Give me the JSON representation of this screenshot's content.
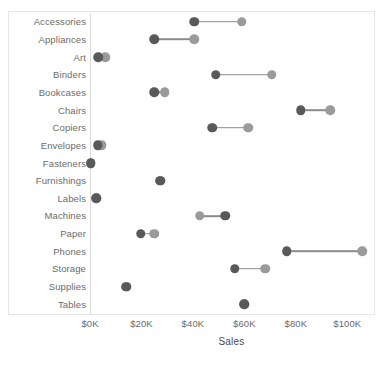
{
  "chart_data": {
    "type": "scatter",
    "subtype": "dumbbell",
    "title": "",
    "xlabel": "Sales",
    "ylabel": "",
    "xlim": [
      0,
      110
    ],
    "grid": false,
    "legend": null,
    "axis": {
      "x_ticks": [
        "$0K",
        "$20K",
        "$40K",
        "$60K",
        "$80K",
        "$100K"
      ],
      "x_tick_values": [
        0,
        20,
        40,
        60,
        80,
        100
      ],
      "x_unit": "thousand USD"
    },
    "categories": [
      "Accessories",
      "Appliances",
      "Art",
      "Binders",
      "Bookcases",
      "Chairs",
      "Copiers",
      "Envelopes",
      "Fasteners",
      "Furnishings",
      "Labels",
      "Machines",
      "Paper",
      "Phones",
      "Storage",
      "Supplies",
      "Tables"
    ],
    "series": [
      {
        "name": "dark",
        "color": "#595959",
        "values": [
          40.5,
          25.0,
          3.3,
          48.8,
          25.0,
          82.0,
          47.5,
          3.0,
          0.3,
          27.3,
          2.5,
          52.5,
          19.8,
          76.4,
          56.2,
          14.0,
          60.0
        ]
      },
      {
        "name": "light",
        "color": "#9a9a9a",
        "values": [
          59.0,
          40.5,
          6.0,
          70.7,
          29.0,
          93.4,
          61.6,
          4.5,
          0.3,
          27.3,
          2.5,
          42.6,
          25.0,
          105.8,
          68.2,
          14.0,
          60.0
        ]
      }
    ],
    "points": [
      {
        "category": "Accessories",
        "dark": 40.5,
        "light": 59.0
      },
      {
        "category": "Appliances",
        "dark": 25.0,
        "light": 40.5
      },
      {
        "category": "Art",
        "dark": 3.3,
        "light": 6.0
      },
      {
        "category": "Binders",
        "dark": 48.8,
        "light": 70.7
      },
      {
        "category": "Bookcases",
        "dark": 25.0,
        "light": 29.0
      },
      {
        "category": "Chairs",
        "dark": 82.0,
        "light": 93.4
      },
      {
        "category": "Copiers",
        "dark": 47.5,
        "light": 61.6
      },
      {
        "category": "Envelopes",
        "dark": 3.0,
        "light": 4.5
      },
      {
        "category": "Fasteners",
        "dark": 0.3,
        "light": 0.3
      },
      {
        "category": "Furnishings",
        "dark": 27.3,
        "light": 27.3
      },
      {
        "category": "Labels",
        "dark": 2.5,
        "light": 2.5
      },
      {
        "category": "Machines",
        "dark": 52.5,
        "light": 42.6
      },
      {
        "category": "Paper",
        "dark": 19.8,
        "light": 25.0
      },
      {
        "category": "Phones",
        "dark": 76.4,
        "light": 105.8
      },
      {
        "category": "Storage",
        "dark": 56.2,
        "light": 68.2
      },
      {
        "category": "Supplies",
        "dark": 14.0,
        "light": 14.0
      },
      {
        "category": "Tables",
        "dark": 60.0,
        "light": 60.0
      }
    ],
    "colors": {
      "dark_marker": "#595959",
      "light_marker": "#9a9a9a",
      "connector": "#8a8a8a",
      "axis": "#dcdcdc",
      "frame": "#e6e6e6",
      "text": "#6b6b6b",
      "background": "#ffffff"
    }
  }
}
